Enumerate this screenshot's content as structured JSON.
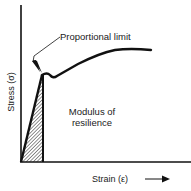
{
  "diagram": {
    "type": "stress-strain-curve",
    "labels": {
      "proportional_limit": "Proportional limit",
      "modulus_line1": "Modulus of",
      "modulus_line2": "resilience",
      "x_axis": "Strain (ε)",
      "y_axis": "Stress (σ)"
    },
    "colors": {
      "ink": "#111111",
      "background": "#ffffff"
    },
    "shaded_region": "modulus-of-resilience (area under elastic portion)"
  }
}
